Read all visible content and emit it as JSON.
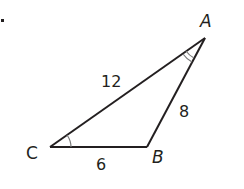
{
  "diagram": {
    "type": "triangle",
    "vertices": {
      "A": {
        "label": "A",
        "x": 205,
        "y": 38
      },
      "B": {
        "label": "B",
        "x": 147,
        "y": 147
      },
      "C": {
        "label": "C",
        "x": 50,
        "y": 147
      }
    },
    "sides": {
      "CA": {
        "label": "12"
      },
      "AB": {
        "label": "8"
      },
      "CB": {
        "label": "6"
      }
    },
    "angle_marks": {
      "C": {
        "arcs": 1
      },
      "A": {
        "arcs": 2
      }
    },
    "colors": {
      "stroke": "#231f20",
      "angle_mark": "#7a7a7a"
    }
  }
}
